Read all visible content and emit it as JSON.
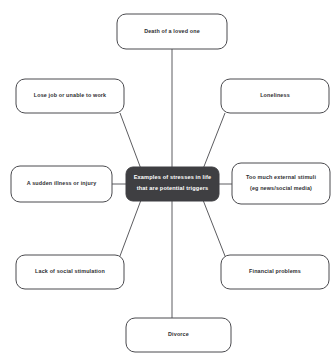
{
  "diagram": {
    "type": "mind-map",
    "title": "Examples of stresses in life that are potential triggers",
    "center": {
      "id": "center-node",
      "line1": "Examples of stresses in life",
      "line2": "that are potential triggers",
      "fill": "#3f3f42",
      "text_color": "#ffffff"
    },
    "branches": [
      {
        "id": "death-of-a-loved-one",
        "position": "top",
        "line1": "Death of a loved one",
        "line2": ""
      },
      {
        "id": "lose-job-or-unable-to-work",
        "position": "top-left",
        "line1": "Lose job or unable to work",
        "line2": ""
      },
      {
        "id": "loneliness",
        "position": "top-right",
        "line1": "Loneliness",
        "line2": ""
      },
      {
        "id": "a-sudden-illness-or-injury",
        "position": "left",
        "line1": "A sudden illness or injury",
        "line2": ""
      },
      {
        "id": "too-much-external-stimuli",
        "position": "right",
        "line1": "Too much external stimuli",
        "line2": "(eg news/social media)"
      },
      {
        "id": "lack-of-social-stimulation",
        "position": "bottom-left",
        "line1": "Lack of social stimulation",
        "line2": ""
      },
      {
        "id": "financial-problems",
        "position": "bottom-right",
        "line1": "Financial problems",
        "line2": ""
      },
      {
        "id": "divorce",
        "position": "bottom",
        "line1": "Divorce",
        "line2": ""
      }
    ],
    "colors": {
      "background": "#ffffff",
      "node_stroke": "#4a4a4e",
      "connector": "#5c5c60",
      "center_fill": "#3f3f42"
    }
  }
}
